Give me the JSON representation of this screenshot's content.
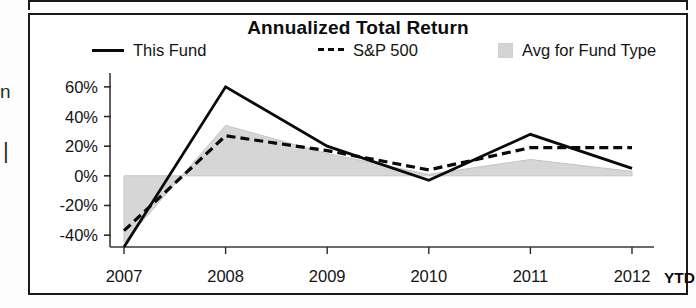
{
  "page": {
    "edge_fragments": [
      "n",
      "|"
    ]
  },
  "chart_panel": {
    "title": "Annualized Total Return",
    "legend": [
      {
        "id": "this-fund",
        "label": "This Fund",
        "marker": "solid-line",
        "color": "#0a0a0a"
      },
      {
        "id": "sp-500",
        "label": "S&P 500",
        "marker": "dashed-line",
        "color": "#0a0a0a"
      },
      {
        "id": "avg-fund-type",
        "label": "Avg for Fund Type",
        "marker": "filled-swatch",
        "color": "#d4d4d4"
      }
    ],
    "ytd_note": "YTD"
  },
  "chart_data": {
    "type": "line",
    "title": "Annualized Total Return",
    "xlabel": "",
    "ylabel": "",
    "categories": [
      "2007",
      "2008",
      "2009",
      "2010",
      "2011",
      "2012"
    ],
    "x_tick_labels": [
      "2007",
      "2008",
      "2009",
      "2010",
      "2011",
      "2012"
    ],
    "y_tick_labels": [
      "60%",
      "40%",
      "20%",
      "0%",
      "-20%",
      "-40%"
    ],
    "y_ticks": [
      60,
      40,
      20,
      0,
      -20,
      -40
    ],
    "ylim": [
      -48,
      68
    ],
    "grid": false,
    "legend_position": "top",
    "series": [
      {
        "name": "This Fund",
        "style": "solid",
        "color": "#0a0a0a",
        "values": [
          -48,
          60,
          20,
          -3,
          28,
          5
        ]
      },
      {
        "name": "S&P 500",
        "style": "dashed",
        "color": "#0a0a0a",
        "values": [
          -37,
          27,
          17,
          4,
          19,
          19
        ]
      },
      {
        "name": "Avg for Fund Type",
        "style": "area",
        "color": "#d4d4d4",
        "values": [
          -45,
          34,
          15,
          1,
          11,
          3
        ]
      }
    ]
  }
}
